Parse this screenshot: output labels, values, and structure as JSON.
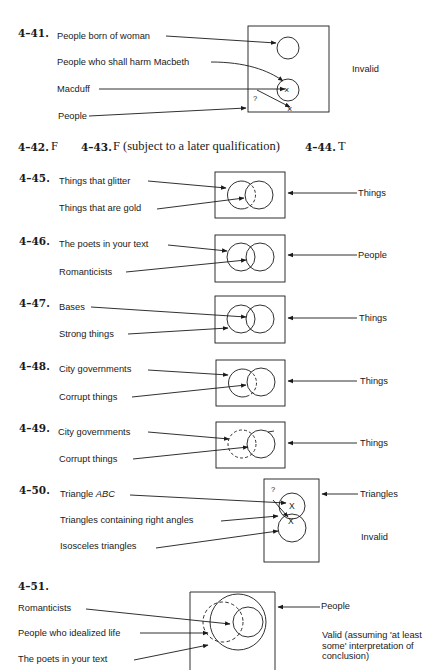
{
  "exercises": {
    "e41": {
      "number": "4–41.",
      "labels": [
        "People born of woman",
        "People who shall harm Macbeth",
        "Macduff",
        "People"
      ],
      "question_mark": "?",
      "x_mark": "×",
      "verdict": "Invalid"
    },
    "inline_answers": [
      {
        "number": "4–42.",
        "answer": "F"
      },
      {
        "number": "4–43.",
        "answer": "F (subject to a later qualification)"
      },
      {
        "number": "4–44.",
        "answer": "T"
      }
    ],
    "e45": {
      "number": "4–45.",
      "labels": [
        "Things that glitter",
        "Things that are gold"
      ],
      "universe": "Things"
    },
    "e46": {
      "number": "4–46.",
      "labels": [
        "The poets in your text",
        "Romanticists"
      ],
      "universe": "People"
    },
    "e47": {
      "number": "4–47.",
      "labels": [
        "Bases",
        "Strong things"
      ],
      "universe": "Things"
    },
    "e48": {
      "number": "4–48.",
      "labels": [
        "City governments",
        "Corrupt things"
      ],
      "universe": "Things"
    },
    "e49": {
      "number": "4–49.",
      "labels": [
        "City governments",
        "Corrupt things"
      ],
      "universe": "Things"
    },
    "e50": {
      "number": "4–50.",
      "label_triangle": "Triangle",
      "label_abc": "ABC",
      "labels": [
        "Triangles containing right angles",
        "Isosceles triangles"
      ],
      "universe": "Triangles",
      "question_mark": "?",
      "x_mark": "X",
      "verdict": "Invalid"
    },
    "e51": {
      "number": "4–51.",
      "labels": [
        "Romanticists",
        "People who idealized life",
        "The poets in your text"
      ],
      "universe": "People",
      "verdict": "Valid (assuming 'at least some' interpretation of conclusion)"
    }
  }
}
